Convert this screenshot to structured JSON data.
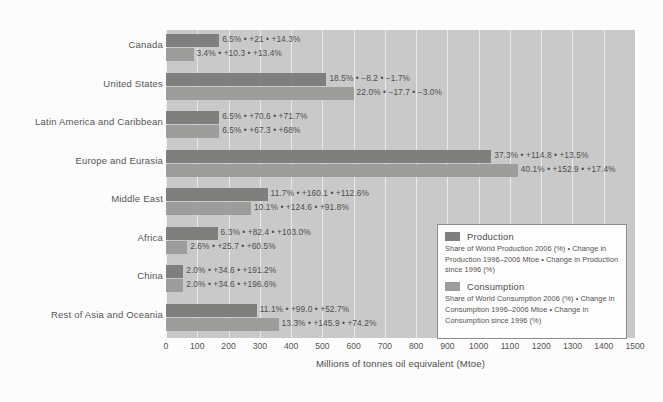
{
  "chart_data": {
    "type": "bar",
    "orientation": "horizontal",
    "title": "",
    "xlabel": "Millions of tonnes oil equivalent (Mtoe)",
    "ylabel": "",
    "xlim": [
      0,
      1500
    ],
    "xticks": [
      "0",
      "100",
      "200",
      "300",
      "400",
      "500",
      "600",
      "700",
      "800",
      "900",
      "1000",
      "1100",
      "1200",
      "1300",
      "1400",
      "1500"
    ],
    "grid": "vertical-white-gridlines",
    "legend_position": "lower-right-inside",
    "categories": [
      "Canada",
      "United States",
      "Latin America and Caribbean",
      "Europe and Eurasia",
      "Middle East",
      "Africa",
      "China",
      "Rest of Asia and Oceania"
    ],
    "series": [
      {
        "name": "Production",
        "color": "#7f7f7e",
        "values": [
          170,
          513,
          170,
          1040,
          325,
          165,
          55,
          290
        ],
        "labels": [
          "6.5% • +21 • +14.3%",
          "18.5% • −8.2 • −1.7%",
          "6.5% • +70.6 • +71.7%",
          "37.3% • +114.8 • +13.5%",
          "11.7% • +160.1 • +112.6%",
          "6.3% • +82.4 • +103.0%",
          "2.0% • +34.6 • +191.2%",
          "11.1% • +99.0 • +52.7%"
        ]
      },
      {
        "name": "Consumption",
        "color": "#9d9d9c",
        "values": [
          88,
          600,
          170,
          1125,
          272,
          68,
          55,
          360
        ],
        "labels": [
          "3.4% • +10.3 • +13.4%",
          "22.0% • −17.7 • −3.0%",
          "6.5% • +67.3 • +68%",
          "40.1% • +152.9 • +17.4%",
          "10.1% • +124.6 • +91.8%",
          "2.6% • +25.7 • +60.5%",
          "2.0% • +34.6 • +196.6%",
          "13.3% • +145.9 • +74.2%"
        ]
      }
    ]
  },
  "legend": {
    "production": {
      "title": "Production",
      "description": "Share of World Production 2006 (%) • Change in Production 1996–2006 Mtoe • Change in Production since 1996 (%)"
    },
    "consumption": {
      "title": "Consumption",
      "description": "Share of World Consumption 2006 (%) • Change in Consumption 1996–2006 Mtoe • Change in Consumption since 1996 (%)"
    }
  },
  "colors": {
    "plot_background": "#c9c9c9",
    "gridline": "#efefef",
    "production_bar": "#7f7f7e",
    "consumption_bar": "#9d9d9c",
    "text": "#4e4e4d"
  }
}
